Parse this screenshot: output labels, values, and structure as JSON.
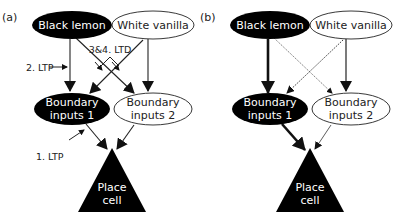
{
  "figure": {
    "panels": [
      {
        "label": "(a)",
        "nodes": {
          "black_lemon": "Black lemon",
          "white_vanilla": "White vanilla",
          "boundary1_line1": "Boundary",
          "boundary1_line2": "inputs 1",
          "boundary2_line1": "Boundary",
          "boundary2_line2": "inputs 2",
          "place_line1": "Place",
          "place_line2": "cell"
        },
        "annotations": {
          "ltd": "3&4. LTD",
          "ltp2": "2. LTP",
          "ltp1": "1. LTP"
        },
        "edges": [
          {
            "from": "Black lemon",
            "to": "Boundary inputs 1",
            "style": "solid"
          },
          {
            "from": "Black lemon",
            "to": "Boundary inputs 2",
            "style": "solid"
          },
          {
            "from": "White vanilla",
            "to": "Boundary inputs 1",
            "style": "solid"
          },
          {
            "from": "White vanilla",
            "to": "Boundary inputs 2",
            "style": "solid"
          },
          {
            "from": "Boundary inputs 1",
            "to": "Place cell",
            "style": "solid"
          },
          {
            "from": "Boundary inputs 2",
            "to": "Place cell",
            "style": "solid"
          }
        ]
      },
      {
        "label": "(b)",
        "nodes": {
          "black_lemon": "Black lemon",
          "white_vanilla": "White vanilla",
          "boundary1_line1": "Boundary",
          "boundary1_line2": "inputs 1",
          "boundary2_line1": "Boundary",
          "boundary2_line2": "inputs 2",
          "place_line1": "Place",
          "place_line2": "cell"
        },
        "edges": [
          {
            "from": "Black lemon",
            "to": "Boundary inputs 1",
            "style": "thick"
          },
          {
            "from": "Black lemon",
            "to": "Boundary inputs 2",
            "style": "thin-dotted"
          },
          {
            "from": "White vanilla",
            "to": "Boundary inputs 1",
            "style": "dotted"
          },
          {
            "from": "White vanilla",
            "to": "Boundary inputs 2",
            "style": "solid"
          },
          {
            "from": "Boundary inputs 1",
            "to": "Place cell",
            "style": "thick"
          },
          {
            "from": "Boundary inputs 2",
            "to": "Place cell",
            "style": "thin"
          }
        ]
      }
    ],
    "colors": {
      "black_node": "#000000",
      "white_node": "#ffffff",
      "stroke": "#222222"
    }
  }
}
